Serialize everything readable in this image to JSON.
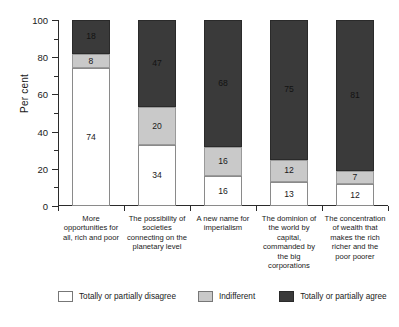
{
  "chart_data": {
    "type": "bar",
    "subtype": "stacked-100-percent",
    "title": "",
    "xlabel": "",
    "ylabel": "Per cent",
    "ylim": [
      0,
      100
    ],
    "yticks": [
      0,
      20,
      40,
      60,
      80,
      100
    ],
    "ytick_labels": [
      "0",
      "20",
      "40",
      "60",
      "80",
      "100"
    ],
    "minor_yticks": [
      10,
      30,
      50,
      70,
      90
    ],
    "grid": false,
    "legend_position": "bottom",
    "categories": [
      "More opportunities for all, rich and poor",
      "The possibility of societies connecting on the planetary level",
      "A new name for imperialism",
      "The dominion of the world by capital, commanded by the big corporations",
      "The concentration of wealth that makes the rich richer and the poor poorer"
    ],
    "category_lines": [
      [
        "More",
        "opportunities for",
        "all, rich and poor"
      ],
      [
        "The possibility of",
        "societies",
        "connecting on the",
        "planetary level"
      ],
      [
        "A new name for",
        "imperialism"
      ],
      [
        "The dominion of",
        "the world by",
        "capital,",
        "commanded by",
        "the big",
        "corporations"
      ],
      [
        "The concentration",
        "of wealth that",
        "makes the rich",
        "richer and the",
        "poor poorer"
      ]
    ],
    "series": [
      {
        "name": "Totally or partially disagree",
        "color": "#ffffff",
        "values": [
          74,
          34,
          16,
          13,
          12
        ]
      },
      {
        "name": "Indifferent",
        "color": "#c9c9c9",
        "values": [
          8,
          20,
          16,
          12,
          7
        ]
      },
      {
        "name": "Totally or partially agree",
        "color": "#3a3a3a",
        "values": [
          18,
          47,
          68,
          75,
          81
        ]
      }
    ]
  },
  "axis": {
    "y_title": "Per cent",
    "y_labels": [
      "100",
      "80",
      "60",
      "40",
      "20",
      "0"
    ]
  },
  "legend": {
    "items": [
      {
        "label": "Totally or partially disagree"
      },
      {
        "label": "Indifferent"
      },
      {
        "label": "Totally or partially agree"
      }
    ]
  },
  "bar_values": {
    "b0": {
      "disagree": "74",
      "indifferent": "8",
      "agree": "18"
    },
    "b1": {
      "disagree": "34",
      "indifferent": "20",
      "agree": "47"
    },
    "b2": {
      "disagree": "16",
      "indifferent": "16",
      "agree": "68"
    },
    "b3": {
      "disagree": "13",
      "indifferent": "12",
      "agree": "75"
    },
    "b4": {
      "disagree": "12",
      "indifferent": "7",
      "agree": "81"
    }
  },
  "categories_text": {
    "c0": "More\nopportunities for\nall, rich and poor",
    "c1": "The possibility of\nsocieties\nconnecting on the\nplanetary level",
    "c2": "A new name for\nimperialism",
    "c3": "The dominion of\nthe world by\ncapital,\ncommanded by\nthe big\ncorporations",
    "c4": "The concentration\nof wealth that\nmakes the rich\nricher and the\npoor poorer"
  }
}
